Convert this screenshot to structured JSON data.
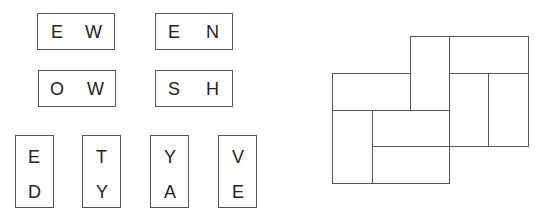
{
  "horizontal_tiles": [
    {
      "letters": [
        "E",
        "W"
      ]
    },
    {
      "letters": [
        "E",
        "N"
      ]
    },
    {
      "letters": [
        "O",
        "W"
      ]
    },
    {
      "letters": [
        "S",
        "H"
      ]
    }
  ],
  "vertical_tiles": [
    {
      "letters": [
        "E",
        "D"
      ]
    },
    {
      "letters": [
        "T",
        "Y"
      ]
    },
    {
      "letters": [
        "Y",
        "A"
      ]
    },
    {
      "letters": [
        "V",
        "E"
      ]
    }
  ],
  "grid": {
    "stroke": "#555555",
    "rects": [
      {
        "x": 410,
        "y": 36,
        "w": 39,
        "h": 74
      },
      {
        "x": 449,
        "y": 36,
        "w": 79,
        "h": 37
      },
      {
        "x": 332,
        "y": 73,
        "w": 78,
        "h": 37
      },
      {
        "x": 449,
        "y": 73,
        "w": 39,
        "h": 73
      },
      {
        "x": 488,
        "y": 73,
        "w": 40,
        "h": 73
      },
      {
        "x": 332,
        "y": 110,
        "w": 40,
        "h": 73
      },
      {
        "x": 372,
        "y": 110,
        "w": 77,
        "h": 36
      },
      {
        "x": 372,
        "y": 146,
        "w": 77,
        "h": 37
      }
    ]
  }
}
